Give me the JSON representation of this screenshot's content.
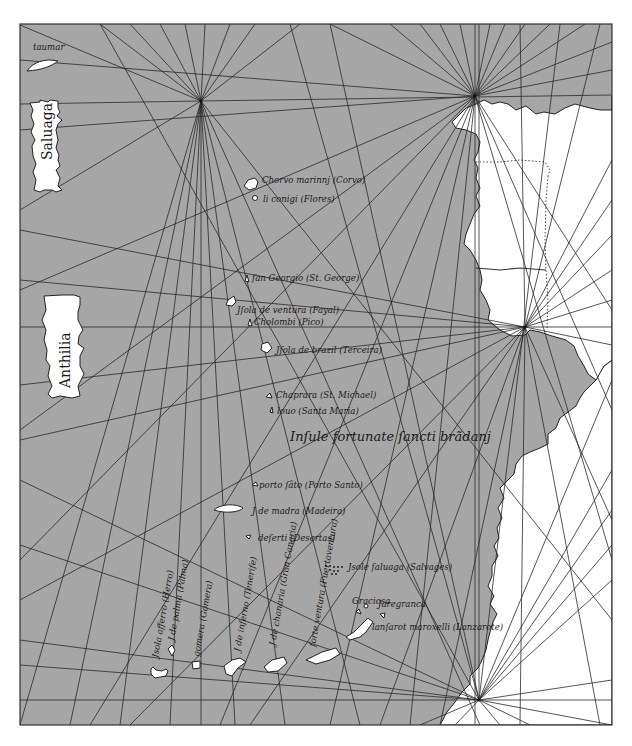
{
  "map": {
    "type": "portolan-chart-reconstruction",
    "colors": {
      "sea": "#a6a6a6",
      "land": "#ffffff",
      "lines": "#2a2a2a",
      "text": "#1a1a1a",
      "page": "#ffffff"
    },
    "frame": {
      "x": 20,
      "y": 24,
      "width": 592,
      "height": 701
    },
    "wind_roses": [
      {
        "id": "rose-nw",
        "x": 201,
        "y": 101
      },
      {
        "id": "rose-n",
        "x": 475,
        "y": 96
      },
      {
        "id": "rose-e",
        "x": 525,
        "y": 327
      },
      {
        "id": "rose-s",
        "x": 479,
        "y": 700
      }
    ],
    "mythical_islands": [
      {
        "id": "taumar",
        "label": "taumar"
      },
      {
        "id": "saluaga",
        "label": "Saluaga"
      },
      {
        "id": "anthilia",
        "label": "Anthilia"
      }
    ],
    "labels": {
      "corvo": "Chorvo marinnj (Corvo)",
      "flores": "li conigi (Flores)",
      "sao_jorge": "ſan Georgio (St. George)",
      "faial": "Jſola de ventura (Fayal)",
      "pico": "Cholombi (Pico)",
      "terceira": "Jſola de brazil (Terceira)",
      "sao_miguel": "Chaprara (St. Michael)",
      "santa_maria": "louo (Santa Maria)",
      "brendan": "Inſule fortunate ſancti brãdanj",
      "porto_santo": "porto ſãto (Porto Santo)",
      "madeira": "J de madra (Madeira)",
      "desertas": "deſerti (Desertas)",
      "selvagens": "Jsole ſaluaga (Salvages)",
      "graciosa": "Graciosa",
      "alegranza": "Jaregranca",
      "lanzarote": "lanſarot maroxelli (Lanzarote)",
      "fuerteventura": "forte ventura (Fuertaventura)",
      "gran_canaria": "J de chanaria (Gran Canaria)",
      "tenerife": "J de inferno (Tenerife)",
      "gomera": "gomera (Gomera)",
      "la_palma": "J de palma (Palma)",
      "hierro": "Jsola afferro (Herro)"
    }
  }
}
